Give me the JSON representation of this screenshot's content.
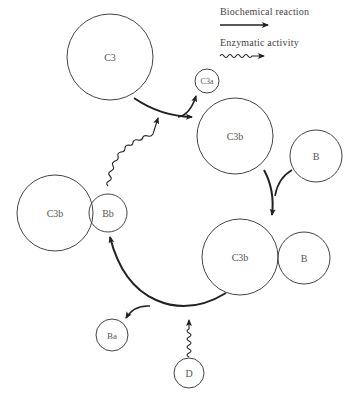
{
  "legend": {
    "biochemical_reaction": "Biochemical reaction",
    "enzymatic_activity": "Enzymatic activity"
  },
  "nodes": {
    "c3": "C3",
    "c3a": "C3a",
    "c3b_top": "C3b",
    "b_top": "B",
    "c3b_bottom": "C3b",
    "b_bottom": "B",
    "c3b_left": "C3b",
    "bb": "Bb",
    "ba": "Ba",
    "d": "D"
  },
  "colors": {
    "stroke": "#222222",
    "circle": "#444444",
    "text": "#555555"
  }
}
